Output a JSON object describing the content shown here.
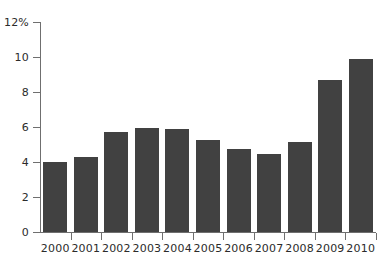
{
  "chart_data": {
    "type": "bar",
    "title": "",
    "subtitle": "",
    "xlabel": "",
    "ylabel": "",
    "categories": [
      "2000",
      "2001",
      "2002",
      "2003",
      "2004",
      "2005",
      "2006",
      "2007",
      "2008",
      "2009",
      "2010"
    ],
    "values": [
      4.0,
      4.3,
      5.7,
      5.95,
      5.9,
      5.25,
      4.75,
      4.45,
      5.15,
      8.7,
      9.9
    ],
    "ylim": [
      0,
      12
    ],
    "ytick_values": [
      0,
      2,
      4,
      6,
      8,
      10,
      12
    ],
    "ytick_labels": [
      "0",
      "2",
      "4",
      "6",
      "8",
      "10",
      "12%"
    ],
    "unit": "%",
    "grid": false,
    "legend": null,
    "legend_position": "none",
    "annotations": [],
    "series": [
      {
        "name": "",
        "values": [
          4.0,
          4.3,
          5.7,
          5.95,
          5.9,
          5.25,
          4.75,
          4.45,
          5.15,
          8.7,
          9.9
        ],
        "color": "#414141"
      }
    ]
  },
  "style": {
    "bar_color": "#414141",
    "axis_color": "#6f6f6f",
    "text_color": "#2b2b2b",
    "background": "#ffffff"
  }
}
